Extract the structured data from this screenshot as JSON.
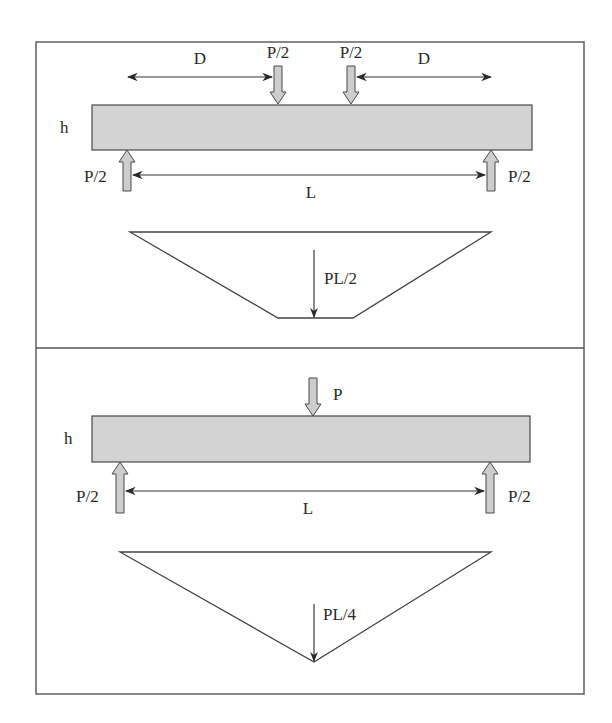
{
  "figure": {
    "type": "beam-bending-diagram",
    "panels": [
      {
        "name": "four-point-bending",
        "height_label": "h",
        "span_label": "L",
        "shear_span_label": "D",
        "load_labels": [
          "P/2",
          "P/2"
        ],
        "reaction_labels": [
          "P/2",
          "P/2"
        ],
        "moment_label": "PL/2",
        "moment_shape": "trapezoid"
      },
      {
        "name": "three-point-bending",
        "height_label": "h",
        "span_label": "L",
        "load_labels": [
          "P"
        ],
        "reaction_labels": [
          "P/2",
          "P/2"
        ],
        "moment_label": "PL/4",
        "moment_shape": "triangle"
      }
    ],
    "colors": {
      "beam_fill": "#d3d3d3",
      "arrow_fill": "#cdcdcd",
      "stroke": "#444444",
      "background": "#ffffff"
    }
  }
}
